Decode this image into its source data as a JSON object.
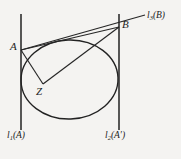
{
  "figure": {
    "width": 181,
    "height": 159,
    "background_color": "#f4f3f1",
    "ink_color": "#262626"
  },
  "points": [
    {
      "id": "A",
      "label": "A",
      "x": 21,
      "y": 50
    },
    {
      "id": "B",
      "label": "B",
      "x": 119,
      "y": 27
    },
    {
      "id": "Z",
      "label": "Z",
      "x": 43,
      "y": 84
    }
  ],
  "lines": [
    {
      "id": "l1",
      "label_main": "l",
      "label_sub": "1",
      "label_arg": "(A)",
      "orientation": "vertical",
      "x": 21,
      "y_top": 14,
      "y_bottom": 130
    },
    {
      "id": "l2",
      "label_main": "l",
      "label_sub": "2",
      "label_arg": "(A′)",
      "orientation": "vertical",
      "x": 119,
      "y_top": 14,
      "y_bottom": 130
    },
    {
      "id": "l3",
      "label_main": "l",
      "label_sub": "3",
      "label_arg": "(B)",
      "orientation": "oblique",
      "x_start": 21,
      "y_start": 50,
      "x_end": 145,
      "y_end": 15
    }
  ],
  "segments": [
    {
      "id": "AB",
      "from": "A",
      "to": "B"
    },
    {
      "id": "AZ",
      "from": "A",
      "to": "Z"
    },
    {
      "id": "ZB",
      "from": "Z",
      "to": "B"
    }
  ],
  "conic": {
    "id": "inscribed-ellipse",
    "type": "ellipse",
    "center_x": 69.5,
    "center_y": 79.5,
    "radius_x": 48.5,
    "radius_y": 39.5,
    "rotation_deg": -2
  },
  "labels": {
    "point_a": "A",
    "point_b": "B",
    "point_z": "Z"
  }
}
